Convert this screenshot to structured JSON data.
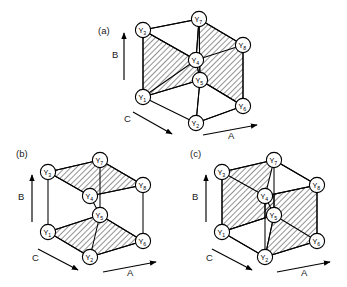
{
  "figure": {
    "background_color": "#ffffff",
    "ink_color": "#000000",
    "node_prefix": "Y",
    "hatch_spacing": 4,
    "hatch_angle_deg": 45,
    "node_radius": 7.6
  },
  "panels": [
    {
      "id": "a",
      "label": "(a)",
      "label_pos": {
        "x": 98,
        "y": 34
      },
      "origin": {
        "x": 128,
        "y": 6
      },
      "nodes": [
        {
          "name": "Y1",
          "base": "Y",
          "sub": "1",
          "x": 143,
          "y": 97
        },
        {
          "name": "Y2",
          "base": "Y",
          "sub": "2",
          "x": 196,
          "y": 123
        },
        {
          "name": "Y3",
          "base": "Y",
          "sub": "3",
          "x": 143,
          "y": 30
        },
        {
          "name": "Y4",
          "base": "Y",
          "sub": "4",
          "x": 196,
          "y": 60
        },
        {
          "name": "Y5",
          "base": "Y",
          "sub": "5",
          "x": 200,
          "y": 80
        },
        {
          "name": "Y6",
          "base": "Y",
          "sub": "6",
          "x": 243,
          "y": 106
        },
        {
          "name": "Y7",
          "base": "Y",
          "sub": "7",
          "x": 199,
          "y": 19
        },
        {
          "name": "Y8",
          "base": "Y",
          "sub": "8",
          "x": 243,
          "y": 45
        }
      ],
      "hatched_faces": [
        {
          "name": "left-front-face",
          "path": "Y3 Y4 Y5 Y1"
        },
        {
          "name": "right-back-face",
          "path": "Y7 Y8 Y6 Y5"
        }
      ],
      "plain_faces": [
        {
          "name": "top-left-face",
          "path": "Y3 Y7 Y4"
        },
        {
          "name": "bottom-right-face",
          "path": "Y5 Y6 Y2"
        }
      ],
      "edges": [
        "Y3-Y7",
        "Y3-Y4",
        "Y7-Y4",
        "Y7-Y8",
        "Y4-Y8",
        "Y3-Y1",
        "Y7-Y5",
        "Y8-Y6",
        "Y1-Y2",
        "Y2-Y6",
        "Y1-Y5",
        "Y5-Y2",
        "Y5-Y6",
        "Y4-Y5",
        "Y1-Y4"
      ],
      "axes": [
        {
          "name": "B",
          "label": "B",
          "label_pos": {
            "x": 112,
            "y": 58
          },
          "from": {
            "x": 124,
            "y": 80
          },
          "to": {
            "x": 124,
            "y": 33
          }
        },
        {
          "name": "C",
          "label": "C",
          "label_pos": {
            "x": 124,
            "y": 122
          },
          "from": {
            "x": 133,
            "y": 112
          },
          "to": {
            "x": 172,
            "y": 134
          }
        },
        {
          "name": "A",
          "label": "A",
          "label_pos": {
            "x": 228,
            "y": 139
          },
          "from": {
            "x": 203,
            "y": 135
          },
          "to": {
            "x": 257,
            "y": 125
          }
        }
      ]
    },
    {
      "id": "b",
      "label": "(b)",
      "label_pos": {
        "x": 16,
        "y": 157
      },
      "origin": {
        "x": 20,
        "y": 150
      },
      "nodes": [
        {
          "name": "Y1",
          "base": "Y",
          "sub": "1",
          "x": 48,
          "y": 232
        },
        {
          "name": "Y2",
          "base": "Y",
          "sub": "2",
          "x": 90,
          "y": 257
        },
        {
          "name": "Y3",
          "base": "Y",
          "sub": "3",
          "x": 48,
          "y": 172
        },
        {
          "name": "Y4",
          "base": "Y",
          "sub": "4",
          "x": 90,
          "y": 196
        },
        {
          "name": "Y5",
          "base": "Y",
          "sub": "5",
          "x": 100,
          "y": 215
        },
        {
          "name": "Y6",
          "base": "Y",
          "sub": "6",
          "x": 143,
          "y": 241
        },
        {
          "name": "Y7",
          "base": "Y",
          "sub": "7",
          "x": 100,
          "y": 160
        },
        {
          "name": "Y8",
          "base": "Y",
          "sub": "8",
          "x": 143,
          "y": 185
        }
      ],
      "hatched_faces": [
        {
          "name": "top-face",
          "path": "Y3 Y7 Y8 Y4"
        },
        {
          "name": "bottom-face",
          "path": "Y1 Y5 Y6 Y2"
        }
      ],
      "plain_faces": [],
      "edges": [
        "Y3-Y7",
        "Y7-Y8",
        "Y8-Y4",
        "Y4-Y3",
        "Y3-Y1",
        "Y7-Y5",
        "Y8-Y6",
        "Y4-Y5",
        "Y1-Y5",
        "Y5-Y6",
        "Y6-Y2",
        "Y2-Y1",
        "Y5-Y2"
      ],
      "axes": [
        {
          "name": "B",
          "label": "B",
          "label_pos": {
            "x": 18,
            "y": 200
          },
          "from": {
            "x": 32,
            "y": 222
          },
          "to": {
            "x": 32,
            "y": 175
          }
        },
        {
          "name": "C",
          "label": "C",
          "label_pos": {
            "x": 32,
            "y": 261
          },
          "from": {
            "x": 38,
            "y": 249
          },
          "to": {
            "x": 78,
            "y": 270
          }
        },
        {
          "name": "A",
          "label": "A",
          "label_pos": {
            "x": 127,
            "y": 276
          },
          "from": {
            "x": 103,
            "y": 272
          },
          "to": {
            "x": 156,
            "y": 262
          }
        }
      ]
    },
    {
      "id": "c",
      "label": "(c)",
      "label_pos": {
        "x": 190,
        "y": 157
      },
      "origin": {
        "x": 190,
        "y": 150
      },
      "nodes": [
        {
          "name": "Y1",
          "base": "Y",
          "sub": "1",
          "x": 222,
          "y": 232
        },
        {
          "name": "Y2",
          "base": "Y",
          "sub": "2",
          "x": 265,
          "y": 257
        },
        {
          "name": "Y3",
          "base": "Y",
          "sub": "3",
          "x": 222,
          "y": 172
        },
        {
          "name": "Y4",
          "base": "Y",
          "sub": "4",
          "x": 265,
          "y": 196
        },
        {
          "name": "Y5",
          "base": "Y",
          "sub": "5",
          "x": 274,
          "y": 215
        },
        {
          "name": "Y6",
          "base": "Y",
          "sub": "6",
          "x": 317,
          "y": 241
        },
        {
          "name": "Y7",
          "base": "Y",
          "sub": "7",
          "x": 274,
          "y": 160
        },
        {
          "name": "Y8",
          "base": "Y",
          "sub": "8",
          "x": 317,
          "y": 185
        }
      ],
      "hatched_faces": [
        {
          "name": "left-front-face",
          "path": "Y3 Y7 Y5 Y1"
        },
        {
          "name": "right-back-face",
          "path": "Y4 Y8 Y6 Y2"
        }
      ],
      "plain_faces": [
        {
          "name": "top-right-face",
          "path": "Y7 Y8 Y4"
        },
        {
          "name": "bottom-left-face",
          "path": "Y1 Y5 Y2"
        }
      ],
      "edges": [
        "Y3-Y7",
        "Y7-Y8",
        "Y8-Y4",
        "Y4-Y3",
        "Y3-Y1",
        "Y7-Y5",
        "Y8-Y6",
        "Y4-Y5",
        "Y1-Y5",
        "Y5-Y6",
        "Y6-Y2",
        "Y2-Y1",
        "Y5-Y2",
        "Y4-Y2"
      ],
      "axes": [
        {
          "name": "B",
          "label": "B",
          "label_pos": {
            "x": 192,
            "y": 200
          },
          "from": {
            "x": 206,
            "y": 222
          },
          "to": {
            "x": 206,
            "y": 175
          }
        },
        {
          "name": "C",
          "label": "C",
          "label_pos": {
            "x": 206,
            "y": 261
          },
          "from": {
            "x": 212,
            "y": 249
          },
          "to": {
            "x": 252,
            "y": 270
          }
        },
        {
          "name": "A",
          "label": "A",
          "label_pos": {
            "x": 301,
            "y": 276
          },
          "from": {
            "x": 277,
            "y": 272
          },
          "to": {
            "x": 330,
            "y": 262
          }
        }
      ]
    }
  ]
}
